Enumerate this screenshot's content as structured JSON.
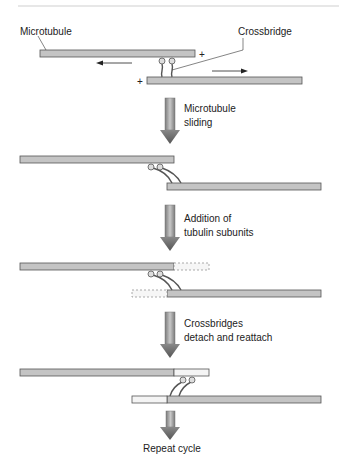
{
  "labels": {
    "microtubule": "Microtubule",
    "crossbridge": "Crossbridge",
    "plus_top": "+",
    "plus_bottom": "+"
  },
  "steps": [
    {
      "line1": "Microtubule",
      "line2": "sliding"
    },
    {
      "line1": "Addition of",
      "line2": "tubulin subunits"
    },
    {
      "line1": "Crossbridges",
      "line2": "detach and reattach"
    }
  ],
  "final_label": "Repeat cycle",
  "colors": {
    "bar_fill": "#c4c4c4",
    "bar_stroke": "#555555",
    "new_subunit_fill": "#f2f2f2",
    "arrow_dark": "#6a6a6a",
    "arrow_light": "#b8b8b8",
    "rule": "#cfcfcf"
  }
}
